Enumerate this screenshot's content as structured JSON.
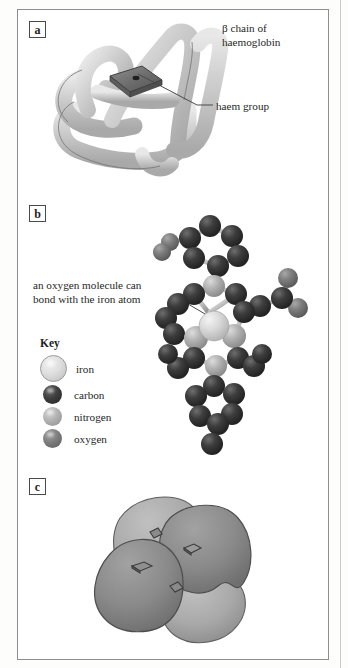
{
  "figure": {
    "panels": [
      {
        "tag": "a",
        "caption_main": "β chain of\nhaemoglobin",
        "caption_line1": "β chain of",
        "caption_line2": "haemoglobin",
        "callout": "haem group"
      },
      {
        "tag": "b",
        "annotation_line1": "an oxygen molecule can",
        "annotation_line2": "bond with the iron atom"
      },
      {
        "tag": "c"
      }
    ]
  },
  "key": {
    "title": "Key",
    "items": [
      {
        "label": "iron",
        "icon": "sphere-iron-icon",
        "color": "#dedede"
      },
      {
        "label": "carbon",
        "icon": "sphere-carbon-icon",
        "color": "#3d3d3d"
      },
      {
        "label": "nitrogen",
        "icon": "sphere-nitrogen-icon",
        "color": "#b2b2b2"
      },
      {
        "label": "oxygen",
        "icon": "sphere-oxygen-icon",
        "color": "#7d7d7d"
      }
    ]
  },
  "colors": {
    "frame": "#8d8d8d",
    "ribbon": "#c8c8c8",
    "ribbon_outline": "#6f6f6f",
    "haem_disc": "#6e6e6e",
    "subunit_light": "#a8a8a8",
    "subunit_dark": "#8a8a8a",
    "text": "#262626",
    "page": "#ffffff"
  }
}
